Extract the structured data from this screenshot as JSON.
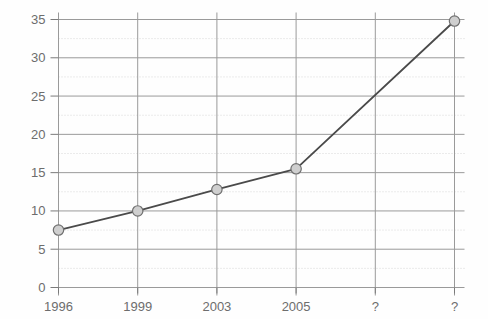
{
  "chart_data": {
    "type": "line",
    "title": "",
    "subtitle": "",
    "xlabel": "",
    "ylabel": "",
    "categories": [
      "1996",
      "1999",
      "2003",
      "2005",
      "?",
      "?"
    ],
    "x": [
      0,
      1,
      2,
      3,
      4,
      5
    ],
    "values": [
      7.5,
      10,
      12.8,
      15.5,
      null,
      34.8
    ],
    "series": [
      {
        "name": "",
        "values": [
          7.5,
          10,
          12.8,
          15.5,
          null,
          34.8
        ]
      }
    ],
    "ylim": [
      0,
      35
    ],
    "xlim": [
      0,
      5
    ],
    "ytick_labels": [
      "0",
      "5",
      "10",
      "15",
      "20",
      "25",
      "30",
      "35"
    ],
    "ytick_values": [
      0,
      5,
      10,
      15,
      20,
      25,
      30,
      35
    ],
    "yminor_values": [
      2.5,
      7.5,
      12.5,
      17.5,
      22.5,
      27.5,
      32.5
    ],
    "grid": "both",
    "grid_major": true,
    "grid_minor_dotted": true,
    "legend": "none",
    "legend_position": "",
    "annotations": [],
    "marker": "circle",
    "colors": {
      "line": "#4a4a4a",
      "marker_fill": "#cfcfcf",
      "marker_stroke": "#6f6f6f",
      "grid_major": "#9a9a9a",
      "grid_minor": "#d8d8d8",
      "axis": "#7a7a7a",
      "tick_text": "#6d6d6d",
      "background": "#fefefe"
    }
  },
  "axes": {
    "y_ticks": [
      {
        "label": "35",
        "value": 35
      },
      {
        "label": "30",
        "value": 30
      },
      {
        "label": "25",
        "value": 25
      },
      {
        "label": "20",
        "value": 20
      },
      {
        "label": "15",
        "value": 15
      },
      {
        "label": "10",
        "value": 10
      },
      {
        "label": "5",
        "value": 5
      },
      {
        "label": "0",
        "value": 0
      }
    ],
    "x_ticks": [
      {
        "label": "1996",
        "index": 0
      },
      {
        "label": "1999",
        "index": 1
      },
      {
        "label": "2003",
        "index": 2
      },
      {
        "label": "2005",
        "index": 3
      },
      {
        "label": "?",
        "index": 4
      },
      {
        "label": "?",
        "index": 5
      }
    ]
  }
}
